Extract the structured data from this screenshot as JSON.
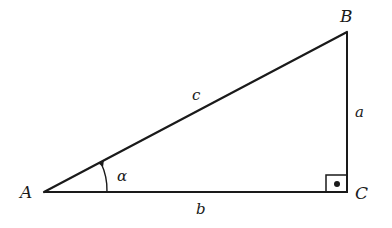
{
  "diagram": {
    "type": "right-triangle",
    "vertices": {
      "A": {
        "label": "A",
        "x": 44,
        "y": 192
      },
      "B": {
        "label": "B",
        "x": 347,
        "y": 32
      },
      "C": {
        "label": "C",
        "x": 347,
        "y": 192
      }
    },
    "sides": {
      "a": {
        "label": "a",
        "between": "B-C"
      },
      "b": {
        "label": "b",
        "between": "A-C"
      },
      "c": {
        "label": "c",
        "between": "A-B"
      }
    },
    "angle": {
      "label": "α",
      "vertex": "A"
    },
    "right_angle_vertex": "C",
    "stroke_color": "#1a1a1a"
  }
}
